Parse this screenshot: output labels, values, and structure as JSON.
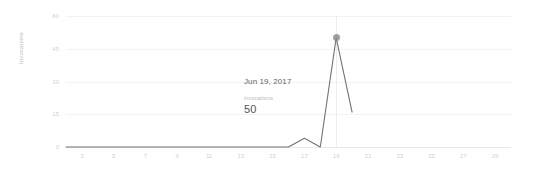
{
  "axes": {
    "y_title": "Invocations",
    "y_ticks": [
      "60",
      "45",
      "30",
      "15",
      "0"
    ],
    "x_ticks": [
      "3",
      "5",
      "7",
      "9",
      "11",
      "13",
      "15",
      "17",
      "19",
      "21",
      "23",
      "25",
      "27",
      "29"
    ]
  },
  "tooltip": {
    "date": "Jun 19, 2017",
    "metric_label": "invocations",
    "value": "50"
  },
  "colors": {
    "line": "#6e7478",
    "grid": "#f2f3f4",
    "baseline": "#e9eaeb",
    "tick_text": "#cfd2d4",
    "tooltip_date": "#5d6265",
    "tooltip_value": "#4f5457",
    "marker": "#8a8f93"
  },
  "chart_data": {
    "type": "line",
    "title": "",
    "xlabel": "",
    "ylabel": "Invocations",
    "xlim": [
      2,
      30
    ],
    "ylim": [
      0,
      60
    ],
    "grid": true,
    "legend": false,
    "y_ticks": [
      60,
      45,
      30,
      15,
      0
    ],
    "x_ticks": [
      3,
      5,
      7,
      9,
      11,
      13,
      15,
      17,
      19,
      21,
      23,
      25,
      27,
      29
    ],
    "series": [
      {
        "name": "invocations",
        "x": [
          2,
          3,
          4,
          5,
          6,
          7,
          8,
          9,
          10,
          11,
          12,
          13,
          14,
          15,
          16,
          17,
          18,
          19,
          20
        ],
        "values": [
          0,
          0,
          0,
          0,
          0,
          0,
          0,
          0,
          0,
          0,
          0,
          0,
          0,
          0,
          0,
          4,
          0,
          50,
          16
        ]
      }
    ],
    "annotations": [
      {
        "x": 19,
        "y": 50,
        "date": "Jun 19, 2017",
        "metric": "invocations",
        "value": 50,
        "marker": true,
        "hover_line": true
      }
    ]
  }
}
